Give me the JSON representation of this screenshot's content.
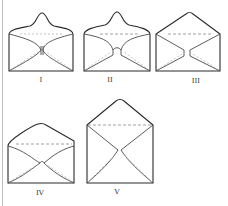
{
  "figure": {
    "envelopes": [
      {
        "id": "I",
        "label": "I",
        "flap_style": "curved-pointed peak"
      },
      {
        "id": "II",
        "label": "II",
        "flap_style": "curved-pointed peak, wider pinch"
      },
      {
        "id": "III",
        "label": "III",
        "flap_style": "straight triangular flap"
      },
      {
        "id": "IV",
        "label": "IV",
        "flap_style": "low triangular flap"
      },
      {
        "id": "V",
        "label": "V",
        "flap_style": "tall triangular flap, deep body"
      }
    ],
    "colors": {
      "line": "#2a2a2a",
      "dashed": "#8a8a8a",
      "background": "#ffffff"
    }
  }
}
